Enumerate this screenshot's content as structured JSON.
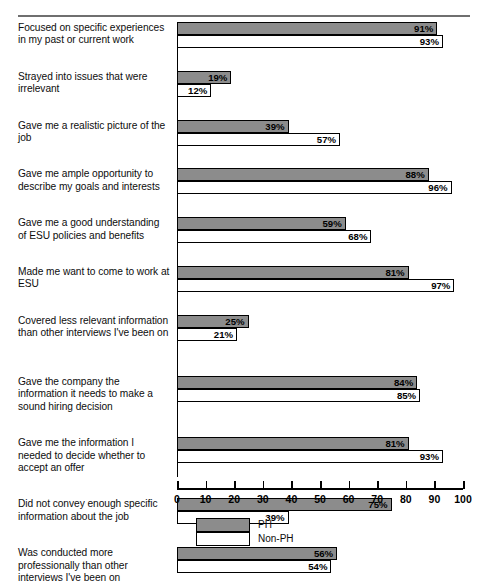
{
  "chart_data": {
    "type": "bar",
    "orientation": "horizontal",
    "title": "",
    "xlabel": "",
    "ylabel": "",
    "xlim": [
      0,
      100
    ],
    "xticks": [
      0,
      10,
      20,
      30,
      40,
      50,
      60,
      70,
      80,
      90,
      100
    ],
    "xtick_labels": [
      "0",
      "10",
      "20",
      "30",
      "40",
      "50",
      "60",
      "70",
      "80",
      "90",
      "100"
    ],
    "grid": false,
    "value_suffix": "%",
    "legend_position": "bottom",
    "categories": [
      "Focused on specific experiences in my past or current work",
      "Strayed into issues that were irrelevant",
      "Gave me a realistic picture of the job",
      "Gave me ample opportunity to describe my goals and interests",
      "Gave me a good understanding of ESU policies and benefits",
      "Made me want to come to work at ESU",
      "Covered less relevant information than other interviews I've been on",
      "Gave the company the information it needs to make a sound hiring decision",
      "Gave me the information I needed to decide whether to accept an offer",
      "Did not convey enough specific information about the job",
      "Was conducted more professionally than other interviews I've been on"
    ],
    "series": [
      {
        "name": "PH",
        "color": "#8c8c8c",
        "values": [
          91,
          19,
          39,
          88,
          59,
          81,
          25,
          84,
          81,
          75,
          56
        ],
        "labels": [
          "91%",
          "19%",
          "39%",
          "88%",
          "59%",
          "81%",
          "25%",
          "84%",
          "81%",
          "75%",
          "56%"
        ]
      },
      {
        "name": "Non-PH",
        "color": "#ffffff",
        "values": [
          93,
          12,
          57,
          96,
          68,
          97,
          21,
          85,
          93,
          39,
          54
        ],
        "labels": [
          "93%",
          "12%",
          "57%",
          "96%",
          "68%",
          "97%",
          "21%",
          "85%",
          "93%",
          "39%",
          "54%"
        ]
      }
    ]
  },
  "legend": {
    "items": [
      {
        "label": "PH",
        "swatch": "ph"
      },
      {
        "label": "Non-PH",
        "swatch": "nonph"
      }
    ]
  },
  "caption": {
    "text": ""
  }
}
